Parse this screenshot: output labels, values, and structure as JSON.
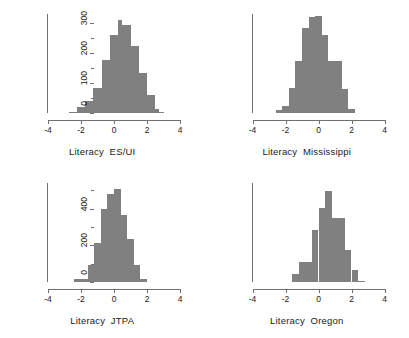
{
  "figure": {
    "type": "histogram-grid",
    "rows": 2,
    "cols": 2,
    "background": "#ffffff",
    "bar_color": "#808080",
    "axis_color": "#707070",
    "text_color": "#1a1a1a"
  },
  "chart_data": [
    {
      "type": "bar",
      "panel": "top-left",
      "title": "",
      "xlabel": "Literacy  ES/UI",
      "ylabel": "",
      "xlim": [
        -4,
        4
      ],
      "ylim": [
        0,
        650
      ],
      "grid": false,
      "legend": null,
      "xticks": [
        -4,
        -2,
        0,
        2,
        4
      ],
      "xticklabels": [
        "-4",
        "-2",
        "0",
        "2",
        "4"
      ],
      "yticks": [
        0,
        200,
        400,
        600
      ],
      "yticklabels": [
        "0",
        "200",
        "400",
        "600"
      ],
      "yminorticks": [
        100,
        300,
        500
      ],
      "bin_width": 0.25,
      "bin_centers": [
        -2.875,
        -2.625,
        -2.375,
        -2.125,
        -1.875,
        -1.625,
        -1.375,
        -1.125,
        -0.875,
        -0.625,
        -0.375,
        -0.125,
        0.125,
        0.375,
        0.625,
        0.875,
        1.125,
        1.375,
        1.625,
        1.875,
        2.125,
        2.375,
        2.625,
        2.875
      ],
      "values": [
        0,
        8,
        8,
        40,
        40,
        80,
        80,
        165,
        165,
        350,
        350,
        510,
        510,
        610,
        575,
        575,
        440,
        440,
        260,
        260,
        120,
        120,
        25,
        5
      ]
    },
    {
      "type": "bar",
      "panel": "top-right",
      "title": "",
      "xlabel": "Literacy  Mississippi",
      "ylabel": "",
      "xlim": [
        -4,
        4
      ],
      "ylim": [
        0,
        330
      ],
      "grid": false,
      "legend": null,
      "xticks": [
        -4,
        -2,
        0,
        2,
        4
      ],
      "xticklabels": [
        "-4",
        "-2",
        "0",
        "2",
        "4"
      ],
      "yticks": [
        0,
        100,
        200,
        300
      ],
      "yticklabels": [
        "0",
        "100",
        "200",
        "300"
      ],
      "yminorticks": [
        50,
        150,
        250
      ],
      "bin_width": 0.4,
      "bin_centers": [
        -2.8,
        -2.4,
        -2.0,
        -1.6,
        -1.2,
        -0.8,
        -0.4,
        0.0,
        0.4,
        0.8,
        1.2,
        1.6,
        2.0,
        2.4
      ],
      "values": [
        0,
        10,
        25,
        85,
        175,
        285,
        320,
        322,
        260,
        175,
        175,
        80,
        15,
        0
      ]
    },
    {
      "type": "bar",
      "panel": "bottom-left",
      "title": "",
      "xlabel": "Literacy  JTPA",
      "ylabel": "",
      "xlim": [
        -4,
        4
      ],
      "ylim": [
        0,
        540
      ],
      "grid": false,
      "legend": null,
      "xticks": [
        -4,
        -2,
        0,
        2,
        4
      ],
      "xticklabels": [
        "-4",
        "-2",
        "0",
        "2",
        "4"
      ],
      "yticks": [
        0,
        200,
        400
      ],
      "yticklabels": [
        "0",
        "200",
        "400"
      ],
      "yminorticks": [
        100,
        300,
        500
      ],
      "bin_width": 0.4,
      "bin_centers": [
        -2.6,
        -2.2,
        -1.8,
        -1.4,
        -1.0,
        -0.6,
        -0.2,
        0.2,
        0.6,
        1.0,
        1.4,
        1.8,
        2.2
      ],
      "values": [
        0,
        15,
        15,
        95,
        215,
        400,
        480,
        510,
        365,
        235,
        95,
        18,
        0
      ]
    },
    {
      "type": "bar",
      "panel": "bottom-right",
      "title": "",
      "xlabel": "Literacy  Oregon",
      "ylabel": "",
      "xlim": [
        -4,
        4
      ],
      "ylim": [
        0,
        540
      ],
      "grid": false,
      "legend": null,
      "xticks": [
        -4,
        -2,
        0,
        2,
        4
      ],
      "xticklabels": [
        "-4",
        "-2",
        "0",
        "2",
        "4"
      ],
      "yticks": [
        0,
        200,
        400
      ],
      "yticklabels": [
        "0",
        "200",
        "400"
      ],
      "yminorticks": [
        100,
        300,
        500
      ],
      "bin_width": 0.4,
      "bin_centers": [
        -1.4,
        -1.0,
        -0.6,
        -0.2,
        0.2,
        0.6,
        1.0,
        1.4,
        1.8,
        2.2,
        2.6
      ],
      "values": [
        45,
        110,
        110,
        285,
        405,
        495,
        350,
        350,
        175,
        65,
        3
      ]
    }
  ]
}
